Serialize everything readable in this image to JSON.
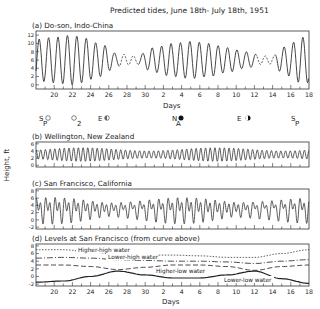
{
  "chart_data": [
    {
      "type": "line",
      "title": "Predicted tides, June 18th- July 18th, 1951",
      "panel": "(a) Do-son, Indo-China",
      "xlabel": "Days",
      "ylabel": "Height, ft",
      "ylim": [
        -1,
        13
      ],
      "yticks": [
        0,
        2,
        4,
        6,
        8,
        10,
        12
      ],
      "xtick_labels": [
        "20",
        "22",
        "24",
        "26",
        "28",
        "30",
        "2",
        "4",
        "6",
        "8",
        "10",
        "12",
        "14",
        "16",
        "18"
      ],
      "tide_type": "diurnal",
      "notes": "Dashed segments around June 27-29 and July 12-14 where tide is nearly absent",
      "envelope": {
        "days": [
          0,
          2,
          4,
          5,
          7,
          9,
          11,
          13,
          15,
          17,
          19,
          21,
          23,
          25,
          26,
          27,
          28,
          29,
          30
        ],
        "amplitude": [
          5,
          5.5,
          6,
          5.5,
          4,
          1.5,
          1,
          3,
          4,
          4.5,
          4,
          3,
          2,
          1,
          1,
          3,
          4,
          5.5,
          5.5
        ]
      }
    },
    {
      "type": "line",
      "panel": "(b) Wellington, New Zealand",
      "ylim": [
        -0.5,
        6.5
      ],
      "yticks": [
        0,
        2,
        4,
        6
      ],
      "tide_type": "semidiurnal",
      "mean": 3,
      "amplitude_range": [
        1.0,
        1.9
      ]
    },
    {
      "type": "line",
      "panel": "(c) San Francisco, California",
      "ylim": [
        -2.5,
        8.5
      ],
      "yticks": [
        -2,
        0,
        2,
        4,
        6,
        8
      ],
      "tide_type": "mixed"
    },
    {
      "type": "line",
      "panel": "(d) Levels at San Francisco (from curve above)",
      "xlabel": "Days",
      "ylim": [
        -2.5,
        8.5
      ],
      "yticks": [
        -2,
        0,
        2,
        4,
        6,
        8
      ],
      "x": [
        0,
        3,
        6,
        9,
        12,
        15,
        18,
        21,
        24,
        27,
        30
      ],
      "series": [
        {
          "name": "Higher-high water",
          "style": "short-dash",
          "values": [
            7.0,
            7.0,
            6.4,
            5.8,
            5.6,
            5.6,
            5.4,
            5.0,
            5.0,
            6.0,
            7.0
          ]
        },
        {
          "name": "Lower-high water",
          "style": "dash-dot",
          "values": [
            4.8,
            5.0,
            4.8,
            4.4,
            4.2,
            4.0,
            4.0,
            3.8,
            3.4,
            4.0,
            4.4
          ]
        },
        {
          "name": "Higher-low water",
          "style": "long-dash",
          "values": [
            3.0,
            3.0,
            2.6,
            1.8,
            2.4,
            3.0,
            3.0,
            2.6,
            1.6,
            2.6,
            3.0
          ]
        },
        {
          "name": "Lower-low water",
          "style": "solid",
          "values": [
            -1.5,
            -1.2,
            0.0,
            1.4,
            0.4,
            -0.4,
            -0.4,
            0.4,
            1.4,
            -0.6,
            -1.8
          ]
        }
      ]
    }
  ],
  "figure": {
    "title": "Predicted tides, June 18th- July 18th, 1951",
    "ylabel": "Height, ft",
    "xlabel_a": "Days",
    "xlabel_d": "Days",
    "panels": {
      "a": "(a) Do-son, Indo-China",
      "b": "(b) Wellington, New Zealand",
      "c": "(c) San Francisco, California",
      "d": "(d) Levels at San Francisco (from curve above)"
    },
    "yticks": {
      "a": [
        "12",
        "10",
        "8",
        "6",
        "4",
        "2",
        "0"
      ],
      "b": [
        "6",
        "4",
        "2",
        "0"
      ],
      "c": [
        "8",
        "6",
        "4",
        "2",
        "0",
        "-2"
      ],
      "d": [
        "8",
        "6",
        "4",
        "2",
        "0",
        "-2"
      ]
    },
    "xticks": [
      "20",
      "22",
      "24",
      "26",
      "28",
      "30",
      "2",
      "4",
      "6",
      "8",
      "10",
      "12",
      "14",
      "16",
      "18"
    ],
    "curve_labels": {
      "hhw": "Higher-high water",
      "lhw": "Lower-high water",
      "hlw": "Higher-low water",
      "llw": "Lower-low water"
    },
    "astro": [
      {
        "main": "S",
        "sub": "P",
        "moon": "full"
      },
      {
        "main": "",
        "sub": "2",
        "moon": "full"
      },
      {
        "main": "E",
        "sub": "",
        "moon": "last-quarter"
      },
      {
        "main": "N",
        "sub": "A",
        "moon": "new"
      },
      {
        "main": "E",
        "sub": "",
        "moon": "first-quarter"
      },
      {
        "main": "S",
        "sub": "P",
        "moon": ""
      }
    ]
  }
}
